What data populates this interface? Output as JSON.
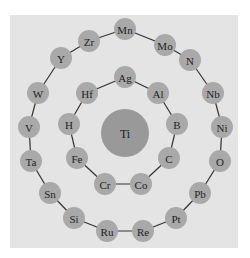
{
  "diagram": {
    "type": "concentric-ring-network",
    "colors": {
      "background": "#ffffff",
      "panel": "#e4e4e4",
      "node": "#a9a9a9",
      "center_node": "#999999",
      "edge": "#333333",
      "text": "#222222"
    },
    "center": {
      "label": "Ti",
      "x": 125,
      "y": 133,
      "r": 24
    },
    "inner_ring": {
      "closed": false,
      "nodes": [
        {
          "label": "Ag",
          "x": 125,
          "y": 77
        },
        {
          "label": "Al",
          "x": 158,
          "y": 93
        },
        {
          "label": "B",
          "x": 177,
          "y": 124
        },
        {
          "label": "C",
          "x": 169,
          "y": 158
        },
        {
          "label": "Co",
          "x": 141,
          "y": 184
        },
        {
          "label": "Cr",
          "x": 105,
          "y": 184
        },
        {
          "label": "Fe",
          "x": 77,
          "y": 158
        },
        {
          "label": "H",
          "x": 69,
          "y": 124
        },
        {
          "label": "Hf",
          "x": 87,
          "y": 93
        }
      ]
    },
    "outer_ring": {
      "closed": false,
      "nodes": [
        {
          "label": "Mn",
          "x": 125,
          "y": 29
        },
        {
          "label": "Mo",
          "x": 165,
          "y": 45
        },
        {
          "label": "N",
          "x": 190,
          "y": 60
        },
        {
          "label": "Nb",
          "x": 213,
          "y": 93
        },
        {
          "label": "Ni",
          "x": 222,
          "y": 127
        },
        {
          "label": "O",
          "x": 220,
          "y": 161
        },
        {
          "label": "Pb",
          "x": 200,
          "y": 193
        },
        {
          "label": "Pt",
          "x": 176,
          "y": 218
        },
        {
          "label": "Re",
          "x": 143,
          "y": 231
        },
        {
          "label": "Ru",
          "x": 107,
          "y": 231
        },
        {
          "label": "Si",
          "x": 74,
          "y": 218
        },
        {
          "label": "Sn",
          "x": 50,
          "y": 193
        },
        {
          "label": "Ta",
          "x": 31,
          "y": 161
        },
        {
          "label": "V",
          "x": 29,
          "y": 127
        },
        {
          "label": "W",
          "x": 38,
          "y": 93
        },
        {
          "label": "Y",
          "x": 61,
          "y": 58
        },
        {
          "label": "Zr",
          "x": 89,
          "y": 41
        }
      ]
    },
    "node_radius": 11
  }
}
